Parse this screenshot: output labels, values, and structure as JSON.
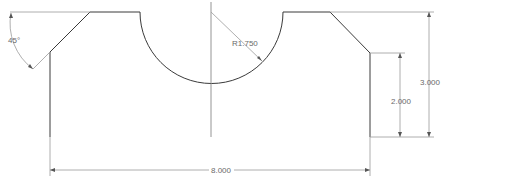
{
  "drawing": {
    "units": "in",
    "dimensions": {
      "width_overall": "8.000",
      "height_overall": "3.000",
      "height_right_step": "2.000",
      "arc_radius": "R1.750",
      "chamfer_angle": "45°"
    }
  },
  "colors": {
    "geometry": "#3a3a3a",
    "dimension": "#9a9a9a",
    "background": "#ffffff"
  }
}
